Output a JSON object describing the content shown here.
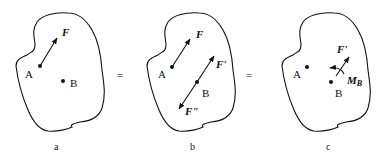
{
  "diagram": {
    "equals_sign": "=",
    "panels": [
      {
        "id": "a",
        "caption": "a",
        "points": [
          {
            "label": "A"
          },
          {
            "label": "B"
          }
        ],
        "forces": [
          {
            "label": "F",
            "at": "A"
          }
        ]
      },
      {
        "id": "b",
        "caption": "b",
        "points": [
          {
            "label": "A"
          },
          {
            "label": "B"
          }
        ],
        "forces": [
          {
            "label": "F",
            "at": "A"
          },
          {
            "label": "F'",
            "at": "B"
          },
          {
            "label": "F\"",
            "at": "B"
          }
        ]
      },
      {
        "id": "c",
        "caption": "c",
        "points": [
          {
            "label": "A"
          },
          {
            "label": "B"
          }
        ],
        "forces": [
          {
            "label": "F'",
            "at": "B"
          }
        ],
        "moments": [
          {
            "label": "M",
            "subscript": "B"
          }
        ]
      }
    ]
  },
  "colors": {
    "ink": "#111111",
    "background": "#ffffff"
  }
}
